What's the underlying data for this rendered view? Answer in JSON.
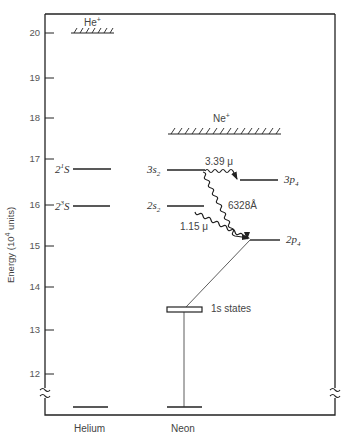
{
  "diagram": {
    "y_axis": {
      "label_prefix": "Energy (10",
      "label_exp": "4",
      "label_suffix": " units)",
      "ticks": [
        "20",
        "19",
        "18",
        "17",
        "16",
        "15",
        "14",
        "13",
        "12"
      ]
    },
    "x_axis": {
      "categories": [
        "Helium",
        "Neon"
      ]
    },
    "helium": {
      "ion_label": "He",
      "ion_charge": "+",
      "level_2_1S": {
        "n": "2",
        "sup": "1",
        "term": "S"
      },
      "level_2_3S": {
        "n": "2",
        "sup": "3",
        "term": "S"
      }
    },
    "neon": {
      "ion_label": "Ne",
      "ion_charge": "+",
      "level_3s2": {
        "main": "3s",
        "sub": "2"
      },
      "level_2s2": {
        "main": "2s",
        "sub": "2"
      },
      "level_3p4": {
        "main": "3p",
        "sub": "4"
      },
      "level_2p4": {
        "main": "2p",
        "sub": "4"
      },
      "level_1s": "1s states"
    },
    "transitions": {
      "t_339": "3.39 μ",
      "t_6328": "6328Å",
      "t_115": "1.15 μ"
    }
  }
}
